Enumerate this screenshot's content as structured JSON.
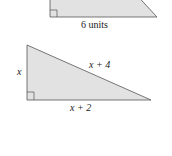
{
  "diagram": {
    "top_triangle": {
      "base_label": "6 units",
      "fill": "#e2e2e2",
      "stroke": "#555555"
    },
    "bottom_triangle": {
      "left_leg_label": "x",
      "hypotenuse_label": "x + 4",
      "base_label": "x + 2",
      "fill": "#e2e2e2",
      "stroke": "#555555"
    }
  }
}
